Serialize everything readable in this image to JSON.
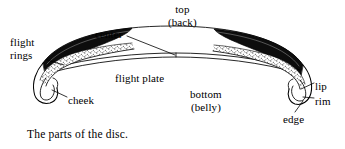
{
  "figure": {
    "caption": "The parts of the disc.",
    "background_color": "#ffffff",
    "ink_color": "#000000"
  },
  "labels": {
    "flight_rings": {
      "line1": "flight",
      "line2": "rings"
    },
    "center": {
      "line1": "center",
      "line2": ""
    },
    "top": {
      "line1": "top",
      "line2": "(back)"
    },
    "flight_plate": {
      "line1": "flight plate",
      "line2": ""
    },
    "cheek": {
      "line1": "cheek",
      "line2": ""
    },
    "bottom": {
      "line1": "bottom",
      "line2": "(belly)"
    },
    "lip": {
      "line1": "lip",
      "line2": ""
    },
    "rim": {
      "line1": "rim",
      "line2": ""
    },
    "edge": {
      "line1": "edge",
      "line2": ""
    }
  },
  "diagram": {
    "top_arc_name": "top-back-surface",
    "flight_plate_name": "flight-plate-surface",
    "flight_rings_band_name": "flight-rings-band",
    "cheek_band_name": "cheek-textured-band",
    "left_rim_name": "left-rim-hook",
    "right_rim_name": "right-rim-hook"
  }
}
